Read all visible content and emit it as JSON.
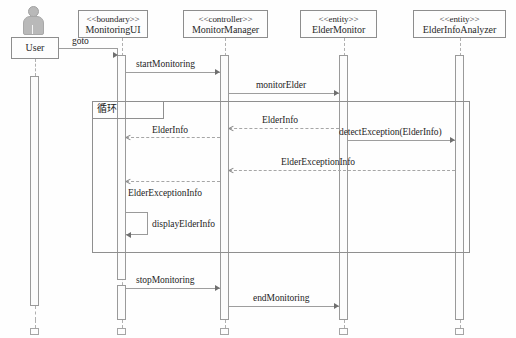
{
  "diagram": {
    "type": "uml-sequence-diagram",
    "title": "",
    "caption": "",
    "background_color": "#ffffff",
    "line_color": "#9e9e9e",
    "text_color": "#252525"
  },
  "actor": {
    "name": "User",
    "icon": "actor-person-icon"
  },
  "participants": [
    {
      "stereotype": "<<boundary>>",
      "name": "MonitoringUI"
    },
    {
      "stereotype": "<<controller>>",
      "name": "MonitorManager"
    },
    {
      "stereotype": "<<entity>>",
      "name": "ElderMonitor"
    },
    {
      "stereotype": "<<entity>>",
      "name": "ElderInfoAnalyzer"
    }
  ],
  "fragment": {
    "label": "循环",
    "kind": "loop"
  },
  "messages": [
    {
      "label": "goto",
      "from": "User",
      "to": "MonitoringUI",
      "kind": "call",
      "direction": "right"
    },
    {
      "label": "startMonitoring",
      "from": "MonitoringUI",
      "to": "MonitorManager",
      "kind": "call",
      "direction": "right"
    },
    {
      "label": "monitorElder",
      "from": "MonitorManager",
      "to": "ElderMonitor",
      "kind": "call",
      "direction": "right"
    },
    {
      "label": "ElderInfo",
      "from": "ElderMonitor",
      "to": "MonitorManager",
      "kind": "return",
      "direction": "left"
    },
    {
      "label": "ElderInfo",
      "from": "MonitorManager",
      "to": "MonitoringUI",
      "kind": "return",
      "direction": "left"
    },
    {
      "label": "detectException(ElderInfo)",
      "from": "ElderMonitor",
      "to": "ElderInfoAnalyzer",
      "kind": "call",
      "direction": "right"
    },
    {
      "label": "ElderExceptionInfo",
      "from": "ElderInfoAnalyzer",
      "to": "MonitorManager",
      "kind": "return",
      "direction": "left"
    },
    {
      "label": "ElderExceptionInfo",
      "from": "MonitorManager",
      "to": "MonitoringUI",
      "kind": "return",
      "direction": "left"
    },
    {
      "label": "displayElderInfo",
      "from": "MonitoringUI",
      "to": "MonitoringUI",
      "kind": "self",
      "direction": "self"
    },
    {
      "label": "stopMonitoring",
      "from": "MonitoringUI",
      "to": "MonitorManager",
      "kind": "call",
      "direction": "right"
    },
    {
      "label": "endMonitoring",
      "from": "MonitorManager",
      "to": "ElderMonitor",
      "kind": "call",
      "direction": "right"
    }
  ]
}
